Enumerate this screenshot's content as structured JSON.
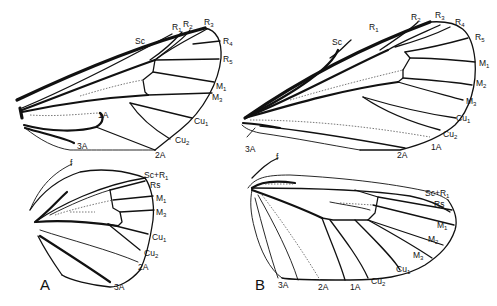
{
  "figure": {
    "panels": [
      {
        "id": "A",
        "label": "A",
        "forewing": {
          "labels": [
            {
              "base": "Sc",
              "sub": ""
            },
            {
              "base": "R",
              "sub": "1"
            },
            {
              "base": "R",
              "sub": "2"
            },
            {
              "base": "R",
              "sub": "3"
            },
            {
              "base": "R",
              "sub": "4"
            },
            {
              "base": "R",
              "sub": "5"
            },
            {
              "base": "M",
              "sub": "1"
            },
            {
              "base": "M",
              "sub": "3"
            },
            {
              "base": "Cu",
              "sub": "1"
            },
            {
              "base": "Cu",
              "sub": "2"
            },
            {
              "base": "2A",
              "sub": ""
            },
            {
              "base": "1A",
              "sub": ""
            },
            {
              "base": "3A",
              "sub": ""
            }
          ]
        },
        "hindwing": {
          "labels": [
            {
              "base": "f",
              "sub": ""
            },
            {
              "base": "Sc+R",
              "sub": "1"
            },
            {
              "base": "Rs",
              "sub": ""
            },
            {
              "base": "M",
              "sub": "1"
            },
            {
              "base": "M",
              "sub": "3"
            },
            {
              "base": "Cu",
              "sub": "1"
            },
            {
              "base": "Cu",
              "sub": "2"
            },
            {
              "base": "2A",
              "sub": ""
            },
            {
              "base": "3A",
              "sub": ""
            }
          ]
        }
      },
      {
        "id": "B",
        "label": "B",
        "forewing": {
          "labels": [
            {
              "base": "Sc",
              "sub": ""
            },
            {
              "base": "R",
              "sub": "1"
            },
            {
              "base": "R",
              "sub": "2"
            },
            {
              "base": "R",
              "sub": "3"
            },
            {
              "base": "R",
              "sub": "4"
            },
            {
              "base": "R",
              "sub": "5"
            },
            {
              "base": "M",
              "sub": "1"
            },
            {
              "base": "M",
              "sub": "2"
            },
            {
              "base": "M",
              "sub": "3"
            },
            {
              "base": "Cu",
              "sub": "1"
            },
            {
              "base": "Cu",
              "sub": "2"
            },
            {
              "base": "1A",
              "sub": ""
            },
            {
              "base": "2A",
              "sub": ""
            },
            {
              "base": "3A",
              "sub": ""
            }
          ]
        },
        "hindwing": {
          "labels": [
            {
              "base": "f",
              "sub": ""
            },
            {
              "base": "Sc+R",
              "sub": "1"
            },
            {
              "base": "Rs",
              "sub": ""
            },
            {
              "base": "M",
              "sub": "1"
            },
            {
              "base": "M",
              "sub": "2"
            },
            {
              "base": "M",
              "sub": "3"
            },
            {
              "base": "Cu",
              "sub": "1"
            },
            {
              "base": "Cu",
              "sub": "2"
            },
            {
              "base": "1A",
              "sub": ""
            },
            {
              "base": "2A",
              "sub": ""
            },
            {
              "base": "3A",
              "sub": ""
            }
          ]
        }
      }
    ]
  }
}
